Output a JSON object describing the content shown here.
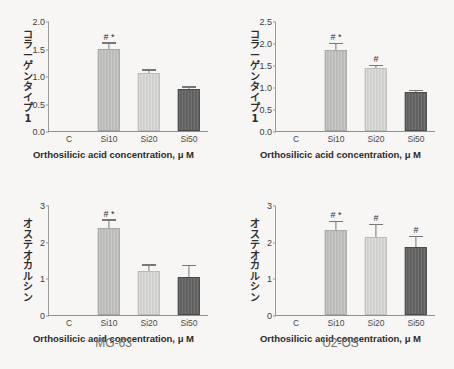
{
  "figure": {
    "xaxis_title": "Orthosilicic acid concentration, μ M",
    "captions": {
      "left": "MG-63",
      "right": "U2-OS"
    }
  },
  "chart_data": [
    {
      "id": "mg63-collagen",
      "type": "bar",
      "title": "",
      "ylabel": "コラーゲンタイプ1",
      "ylabel_chars": [
        "コ",
        "ラ",
        "ー",
        "ゲ",
        "ン",
        "タ",
        "イ",
        "プ",
        "1"
      ],
      "xlabel": "Orthosilicic acid concentration, μ M",
      "categories": [
        "C",
        "Si10",
        "Si20",
        "Si50"
      ],
      "values": [
        0,
        1.5,
        1.05,
        0.77
      ],
      "errors": [
        0,
        0.09,
        0.05,
        0.02
      ],
      "annotations": [
        "",
        "# *",
        "",
        ""
      ],
      "ylim": [
        0,
        2.0
      ],
      "yticks": [
        "0.0",
        "0.5",
        "1.0",
        "1.5",
        "2.0"
      ],
      "ytick_values": [
        0,
        0.5,
        1.0,
        1.5,
        2.0
      ],
      "grid": false,
      "legend": "none",
      "bar_styles": [
        "none",
        "f-mid",
        "f-light",
        "f-dark"
      ]
    },
    {
      "id": "u2os-collagen",
      "type": "bar",
      "title": "",
      "ylabel": "コラーゲンタイプ1",
      "ylabel_chars": [
        "コ",
        "ラ",
        "ー",
        "ゲ",
        "ン",
        "タ",
        "イ",
        "プ",
        "1"
      ],
      "xlabel": "Orthosilicic acid concentration, μ M",
      "categories": [
        "C",
        "Si10",
        "Si20",
        "Si50"
      ],
      "values": [
        0,
        1.83,
        1.43,
        0.88
      ],
      "errors": [
        0,
        0.14,
        0.04,
        0.03
      ],
      "annotations": [
        "",
        "# *",
        "#",
        ""
      ],
      "ylim": [
        0,
        2.5
      ],
      "yticks": [
        "0.0",
        "0.5",
        "1.0",
        "1.5",
        "2.0",
        "2.5"
      ],
      "ytick_values": [
        0,
        0.5,
        1.0,
        1.5,
        2.0,
        2.5
      ],
      "grid": false,
      "legend": "none",
      "bar_styles": [
        "none",
        "f-mid",
        "f-light",
        "f-dark"
      ]
    },
    {
      "id": "mg63-osteocalcin",
      "type": "bar",
      "title": "",
      "ylabel": "オステオカルシン",
      "ylabel_chars": [
        "オ",
        "ス",
        "テ",
        "オ",
        "カ",
        "ル",
        "シ",
        "ン"
      ],
      "xlabel": "Orthosilicic acid concentration, μ M",
      "categories": [
        "C",
        "Si10",
        "Si20",
        "Si50"
      ],
      "values": [
        0,
        2.37,
        1.2,
        1.05
      ],
      "errors": [
        0,
        0.2,
        0.15,
        0.28
      ],
      "annotations": [
        "",
        "# *",
        "",
        ""
      ],
      "ylim": [
        0,
        3
      ],
      "yticks": [
        "0",
        "1",
        "2",
        "3"
      ],
      "ytick_values": [
        0,
        1,
        2,
        3
      ],
      "grid": false,
      "legend": "none",
      "bar_styles": [
        "none",
        "f-mid",
        "f-light",
        "f-dark"
      ]
    },
    {
      "id": "u2os-osteocalcin",
      "type": "bar",
      "title": "",
      "ylabel": "オステオカルシン",
      "ylabel_chars": [
        "オ",
        "ス",
        "テ",
        "オ",
        "カ",
        "ル",
        "シ",
        "ン"
      ],
      "xlabel": "Orthosilicic acid concentration, μ M",
      "categories": [
        "C",
        "Si10",
        "Si20",
        "Si50"
      ],
      "values": [
        0,
        2.33,
        2.13,
        1.85
      ],
      "errors": [
        0,
        0.2,
        0.33,
        0.28
      ],
      "annotations": [
        "",
        "# *",
        "#",
        "#"
      ],
      "ylim": [
        0,
        3
      ],
      "yticks": [
        "0",
        "1",
        "2",
        "3"
      ],
      "ytick_values": [
        0,
        1,
        2,
        3
      ],
      "grid": false,
      "legend": "none",
      "bar_styles": [
        "none",
        "f-mid",
        "f-light",
        "f-dark"
      ]
    }
  ],
  "colors": {
    "background": "#f7f6f4",
    "bar_mid": "#b9b9b7",
    "bar_light": "#cdcdca",
    "bar_dark": "#5e5e5e",
    "axis": "#8e8e8e",
    "text": "#3a3a3a",
    "caption": "#6e6e6e"
  }
}
